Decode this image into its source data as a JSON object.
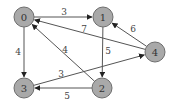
{
  "graph": {
    "type": "directed-weighted",
    "nodes": [
      {
        "id": "0",
        "label": "0",
        "x": 24,
        "y": 17
      },
      {
        "id": "1",
        "label": "1",
        "x": 103,
        "y": 17
      },
      {
        "id": "2",
        "label": "2",
        "x": 102,
        "y": 88
      },
      {
        "id": "3",
        "label": "3",
        "x": 24,
        "y": 88
      },
      {
        "id": "4",
        "label": "4",
        "x": 155,
        "y": 52
      }
    ],
    "edges": [
      {
        "from": "0",
        "to": "1",
        "weight": "3",
        "label_x": 64,
        "label_y": 12
      },
      {
        "from": "0",
        "to": "3",
        "weight": "4",
        "label_x": 18,
        "label_y": 52
      },
      {
        "from": "1",
        "to": "2",
        "weight": "5",
        "label_x": 108,
        "label_y": 51
      },
      {
        "from": "4",
        "to": "1",
        "weight": "6",
        "label_x": 133,
        "label_y": 29
      },
      {
        "from": "4",
        "to": "0",
        "weight": "7",
        "label_x": 84,
        "label_y": 29
      },
      {
        "from": "2",
        "to": "0",
        "weight": "4",
        "label_x": 65,
        "label_y": 50
      },
      {
        "from": "3",
        "to": "4",
        "weight": "3",
        "label_x": 61,
        "label_y": 74
      },
      {
        "from": "2",
        "to": "3",
        "weight": "5",
        "label_x": 67,
        "label_y": 96
      }
    ],
    "colors": {
      "node_fill": "#a9a9a9",
      "node_stroke": "#6e6e6e",
      "edge": "#555555",
      "text": "#333333"
    }
  }
}
